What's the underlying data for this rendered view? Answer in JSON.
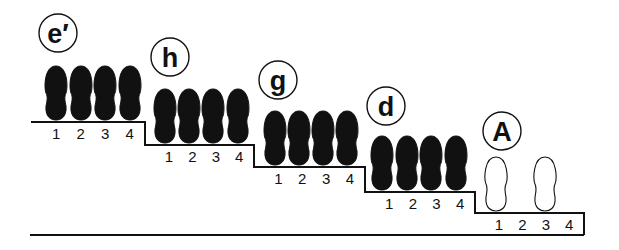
{
  "diagram": {
    "type": "staircase-footprint-sequence",
    "stages": [
      {
        "label": "e′",
        "circle": {
          "cx": 58,
          "cy": 33
        },
        "step": {
          "x1": 31,
          "x2": 145,
          "y": 122
        },
        "positions": [
          "1",
          "2",
          "3",
          "4"
        ],
        "footprints": [
          {
            "pos": "1",
            "cx": 56,
            "style": "filled"
          },
          {
            "pos": "2",
            "cx": 81,
            "style": "filled"
          },
          {
            "pos": "3",
            "cx": 105,
            "style": "filled"
          },
          {
            "pos": "4",
            "cx": 130,
            "style": "filled"
          }
        ]
      },
      {
        "label": "h",
        "circle": {
          "cx": 170,
          "cy": 57
        },
        "step": {
          "x1": 145,
          "x2": 254,
          "y": 145
        },
        "positions": [
          "1",
          "2",
          "3",
          "4"
        ],
        "footprints": [
          {
            "pos": "1",
            "cx": 165,
            "style": "filled"
          },
          {
            "pos": "2",
            "cx": 189,
            "style": "filled"
          },
          {
            "pos": "3",
            "cx": 213,
            "style": "filled"
          },
          {
            "pos": "4",
            "cx": 238,
            "style": "filled"
          }
        ]
      },
      {
        "label": "g",
        "circle": {
          "cx": 278,
          "cy": 80
        },
        "step": {
          "x1": 254,
          "x2": 365,
          "y": 167
        },
        "positions": [
          "1",
          "2",
          "3",
          "4"
        ],
        "footprints": [
          {
            "pos": "1",
            "cx": 275,
            "style": "filled"
          },
          {
            "pos": "2",
            "cx": 299,
            "style": "filled"
          },
          {
            "pos": "3",
            "cx": 323,
            "style": "filled"
          },
          {
            "pos": "4",
            "cx": 347,
            "style": "filled"
          }
        ]
      },
      {
        "label": "d",
        "circle": {
          "cx": 386,
          "cy": 106
        },
        "step": {
          "x1": 365,
          "x2": 475,
          "y": 192
        },
        "positions": [
          "1",
          "2",
          "3",
          "4"
        ],
        "footprints": [
          {
            "pos": "1",
            "cx": 382,
            "style": "filled"
          },
          {
            "pos": "2",
            "cx": 407,
            "style": "filled"
          },
          {
            "pos": "3",
            "cx": 431,
            "style": "filled"
          },
          {
            "pos": "4",
            "cx": 456,
            "style": "filled"
          }
        ]
      },
      {
        "label": "A",
        "circle": {
          "cx": 502,
          "cy": 131
        },
        "step": {
          "x1": 475,
          "x2": 584,
          "y": 213
        },
        "positions": [
          "1",
          "2",
          "3",
          "4"
        ],
        "footprints": [
          {
            "pos": "1",
            "cx": 496,
            "style": "outline"
          },
          {
            "pos": "3",
            "cx": 545,
            "style": "outline"
          }
        ]
      }
    ],
    "baseline": {
      "x1": 30,
      "x2": 584,
      "y": 235
    },
    "colors": {
      "ink": "#111111",
      "background": "#ffffff"
    }
  }
}
